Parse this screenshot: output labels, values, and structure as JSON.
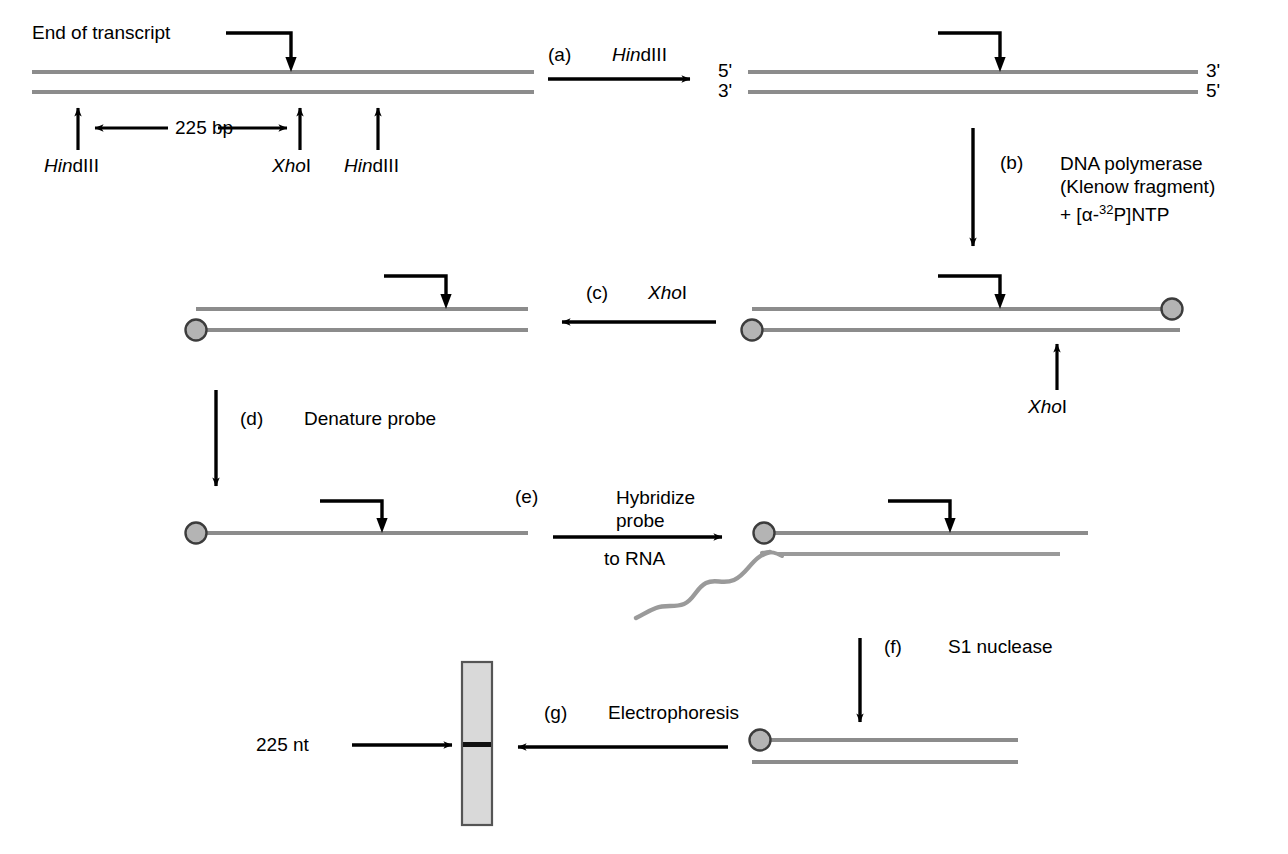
{
  "figure": {
    "title_text": "S1 nuclease mapping of transcript end",
    "colors": {
      "strand": "#8c8c8c",
      "rna": "#9a9a9a",
      "label_dot_fill": "#b4b4b4",
      "label_dot_stroke": "#3c3c3c",
      "gel_lane_fill": "#d9d9d9",
      "gel_lane_stroke": "#555555",
      "gel_band": "#111111",
      "arrow": "#000000",
      "text": "#000000"
    }
  },
  "annotations": {
    "end_of_transcript": "End of transcript",
    "size_bp": "225 bp",
    "hindiii_left": {
      "italic": "Hin",
      "roman": "dIII"
    },
    "xhoi_top": {
      "italic": "Xho",
      "roman": "I"
    },
    "hindiii_right": {
      "italic": "Hin",
      "roman": "dIII"
    },
    "xhoi_step_c_site": {
      "italic": "Xho",
      "roman": "I"
    },
    "five_prime_left": "5'",
    "three_prime_right": "3'",
    "three_prime_left": "3'",
    "five_prime_right": "5'",
    "gel_band_size": "225 nt"
  },
  "steps": [
    {
      "id": "a",
      "tag": "(a)",
      "label_italic": "Hin",
      "label_roman": "dIII",
      "direction": "right"
    },
    {
      "id": "b",
      "tag": "(b)",
      "line1": "DNA polymerase",
      "line2": "(Klenow fragment)",
      "line3_pre": "+ [",
      "line3_alpha": "α",
      "line3_dash": "-",
      "line3_sup": "32",
      "line3_post": "P]NTP",
      "direction": "down"
    },
    {
      "id": "c",
      "tag": "(c)",
      "label_italic": "Xho",
      "label_roman": "I",
      "direction": "left"
    },
    {
      "id": "d",
      "tag": "(d)",
      "label": "Denature probe",
      "direction": "down"
    },
    {
      "id": "e",
      "tag": "(e)",
      "line1": "Hybridize",
      "line2": "probe",
      "line3": "to RNA",
      "direction": "right"
    },
    {
      "id": "f",
      "tag": "(f)",
      "label": "S1 nuclease",
      "direction": "down"
    },
    {
      "id": "g",
      "tag": "(g)",
      "label": "Electrophoresis",
      "direction": "left"
    }
  ],
  "panels": [
    {
      "id": "panel-1",
      "name": "genomic-dna-with-sites",
      "strands": 2,
      "labeled_ends": 0
    },
    {
      "id": "panel-2",
      "name": "hindiii-fragment",
      "strands": 2,
      "labeled_ends": 0
    },
    {
      "id": "panel-3",
      "name": "end-labeled-fragment",
      "strands": 2,
      "labeled_ends": 2
    },
    {
      "id": "panel-4",
      "name": "xhoi-cut-probe",
      "strands": 2,
      "labeled_ends": 1
    },
    {
      "id": "panel-5",
      "name": "denatured-single-strand-probe",
      "strands": 1,
      "labeled_ends": 1
    },
    {
      "id": "panel-6",
      "name": "probe-rna-hybrid",
      "strands": 2,
      "labeled_ends": 1
    },
    {
      "id": "panel-7",
      "name": "s1-protected-duplex",
      "strands": 2,
      "labeled_ends": 1
    },
    {
      "id": "panel-8",
      "name": "gel-lane",
      "band_label": "225 nt"
    }
  ]
}
